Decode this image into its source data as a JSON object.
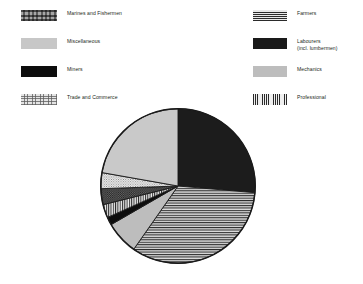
{
  "figure": {
    "background": "#ffffff",
    "text_color": "#231f20"
  },
  "legend": {
    "left_column": [
      {
        "label": "Marines and Fishermen",
        "pattern": "dark-speckle",
        "swatch_class": "pat-marines"
      },
      {
        "label": "Miscellaneous",
        "pattern": "light-gray-solid",
        "swatch_class": "pat-miscellaneous"
      },
      {
        "label": "Miners",
        "pattern": "black-solid",
        "swatch_class": "pat-miners"
      },
      {
        "label": "Trade and Commerce",
        "pattern": "light-stipple",
        "swatch_class": "pat-trade"
      }
    ],
    "right_column": [
      {
        "label": "Farmers",
        "pattern": "horizontal-lines",
        "swatch_class": "pat-farmers"
      },
      {
        "label": "Labourers\n(incl. lumbermen)",
        "pattern": "black-solid",
        "swatch_class": "pat-labourers"
      },
      {
        "label": "Mechanics",
        "pattern": "mid-gray-solid",
        "swatch_class": "pat-mechanics"
      },
      {
        "label": "Professional",
        "pattern": "vertical-lines",
        "swatch_class": "pat-professional"
      }
    ]
  },
  "chart_data": {
    "type": "pie",
    "title": "",
    "legend_position": "top",
    "start_angle_deg": 0,
    "direction": "clockwise",
    "center": {
      "x": 178,
      "y": 186
    },
    "radius": 78,
    "categories": [
      "Labourers (incl. lumbermen)",
      "Farmers",
      "Mechanics",
      "Miners",
      "Professional",
      "Marines and Fishermen",
      "Trade and Commerce",
      "Miscellaneous"
    ],
    "values": [
      26.4,
      33.3,
      6.9,
      1.7,
      2.8,
      3.3,
      3.3,
      22.3
    ],
    "units": "percent",
    "slices": [
      {
        "label": "Labourers (incl. lumbermen)",
        "value": 26.4,
        "start_deg": 0,
        "end_deg": 95,
        "pattern": "black-solid",
        "fill": "#1a1a1a"
      },
      {
        "label": "Farmers",
        "value": 33.3,
        "start_deg": 95,
        "end_deg": 215,
        "pattern": "horizontal-lines",
        "fill": "#c9c9c9"
      },
      {
        "label": "Mechanics",
        "value": 6.9,
        "start_deg": 215,
        "end_deg": 240,
        "pattern": "mid-gray-solid",
        "fill": "#bdbdbd"
      },
      {
        "label": "Miners",
        "value": 1.7,
        "start_deg": 240,
        "end_deg": 246,
        "pattern": "black-solid",
        "fill": "#0d0d0d"
      },
      {
        "label": "Professional",
        "value": 2.8,
        "start_deg": 246,
        "end_deg": 256,
        "pattern": "vertical-lines",
        "fill": "#d0d0d0"
      },
      {
        "label": "Marines and Fishermen",
        "value": 3.3,
        "start_deg": 256,
        "end_deg": 268,
        "pattern": "dark-speckle",
        "fill": "#5d5d5d"
      },
      {
        "label": "Trade and Commerce",
        "value": 3.3,
        "start_deg": 268,
        "end_deg": 280,
        "pattern": "light-stipple",
        "fill": "#e4e4e4"
      },
      {
        "label": "Miscellaneous",
        "value": 22.3,
        "start_deg": 280,
        "end_deg": 360,
        "pattern": "light-gray-solid",
        "fill": "#c7c7c7"
      }
    ]
  }
}
